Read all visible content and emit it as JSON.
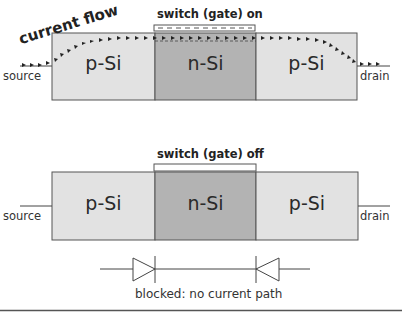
{
  "diagram": {
    "on_state": {
      "gate_label": "switch (gate) on",
      "flow_label": "current flow",
      "source_label": "source",
      "drain_label": "drain",
      "regions": [
        "p-Si",
        "n-Si",
        "p-Si"
      ]
    },
    "off_state": {
      "gate_label": "switch (gate) off",
      "source_label": "source",
      "drain_label": "drain",
      "regions": [
        "p-Si",
        "n-Si",
        "p-Si"
      ],
      "caption": "blocked: no current path"
    },
    "colors": {
      "p_region": "#e2e2e2",
      "n_region": "#b3b3b3",
      "outline": "#555555"
    }
  }
}
